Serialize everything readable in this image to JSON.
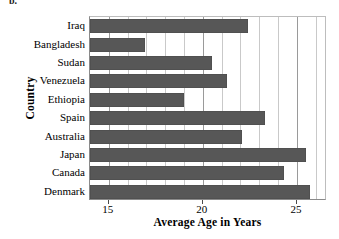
{
  "panel": {
    "label": "b."
  },
  "chart_data": {
    "type": "bar",
    "orientation": "horizontal",
    "title": "",
    "xlabel": "Average Age in Years",
    "ylabel": "Country",
    "categories": [
      "Iraq",
      "Bangladesh",
      "Sudan",
      "Venezuela",
      "Ethiopia",
      "Spain",
      "Australia",
      "Japan",
      "Canada",
      "Denmark"
    ],
    "values": [
      22.4,
      16.9,
      20.5,
      21.3,
      19.0,
      23.3,
      22.1,
      25.5,
      24.3,
      25.7
    ],
    "xlim": [
      14.0,
      26.6
    ],
    "xticks": [
      15,
      20,
      25
    ],
    "xtick_labels": [
      "15",
      "20",
      "25"
    ],
    "gridlines_x": [
      15,
      16,
      17,
      18,
      19,
      20,
      21,
      22,
      23,
      24,
      25,
      26
    ],
    "grid": true,
    "legend": false,
    "bar_color": "#575757",
    "grid_color": "#c9c9c9",
    "axis_color": "#8a8a8a",
    "background": "#ffffff"
  }
}
